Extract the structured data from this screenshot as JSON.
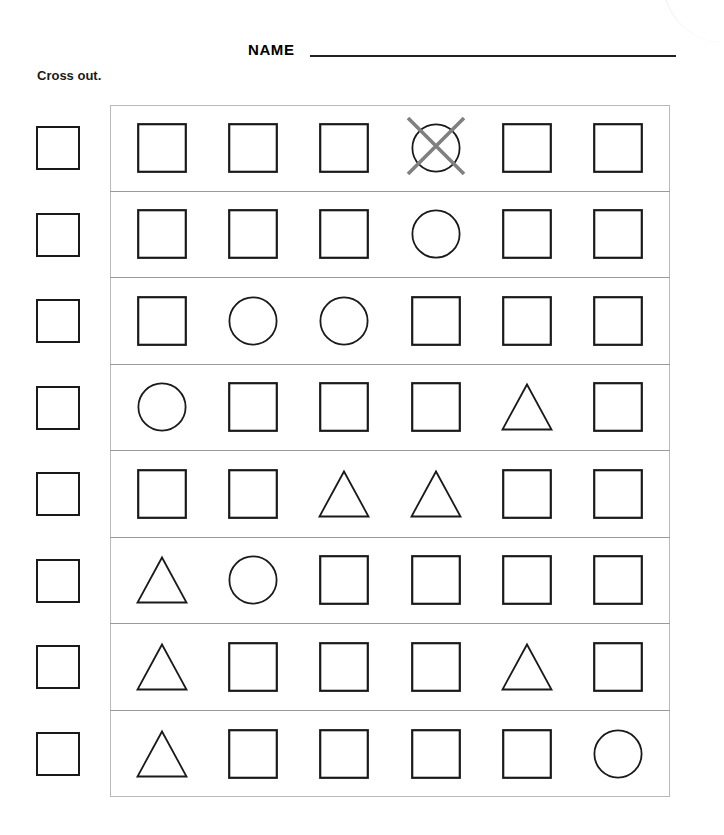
{
  "page": {
    "title": "Cross out.",
    "name_label": "NAME",
    "name_value": "",
    "background": "#ffffff"
  },
  "colors": {
    "shape_stroke": "#1a1a1a",
    "panel_border": "#b9b9b9",
    "row_separator": "#9a9a9a",
    "cross_out_mark": "#808080",
    "text": "#000000"
  },
  "legend": {
    "square": "square-icon",
    "circle": "circle-icon",
    "triangle": "triangle-icon",
    "cross_out": "cross-out-mark-icon",
    "answer_box": "answer-box"
  },
  "rows": [
    {
      "index": 1,
      "answer_box_value": "",
      "shapes": [
        "square",
        "square",
        "square",
        "circle",
        "square",
        "square"
      ],
      "crossed_out_index": 4
    },
    {
      "index": 2,
      "answer_box_value": "",
      "shapes": [
        "square",
        "square",
        "square",
        "circle",
        "square",
        "square"
      ],
      "crossed_out_index": 0
    },
    {
      "index": 3,
      "answer_box_value": "",
      "shapes": [
        "square",
        "circle",
        "circle",
        "square",
        "square",
        "square"
      ],
      "crossed_out_index": 0
    },
    {
      "index": 4,
      "answer_box_value": "",
      "shapes": [
        "circle",
        "square",
        "square",
        "square",
        "triangle",
        "square"
      ],
      "crossed_out_index": 0
    },
    {
      "index": 5,
      "answer_box_value": "",
      "shapes": [
        "square",
        "square",
        "triangle",
        "triangle",
        "square",
        "square"
      ],
      "crossed_out_index": 0
    },
    {
      "index": 6,
      "answer_box_value": "",
      "shapes": [
        "triangle",
        "circle",
        "square",
        "square",
        "square",
        "square"
      ],
      "crossed_out_index": 0
    },
    {
      "index": 7,
      "answer_box_value": "",
      "shapes": [
        "triangle",
        "square",
        "square",
        "square",
        "triangle",
        "square"
      ],
      "crossed_out_index": 0
    },
    {
      "index": 8,
      "answer_box_value": "",
      "shapes": [
        "triangle",
        "square",
        "square",
        "square",
        "square",
        "circle"
      ],
      "crossed_out_index": 0
    }
  ]
}
